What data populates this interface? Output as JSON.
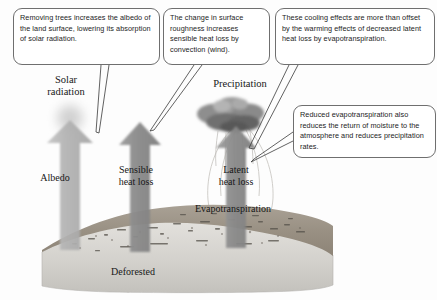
{
  "figure": {
    "type": "process-diagram",
    "scene_label": "Deforested"
  },
  "callouts": [
    {
      "id": "albedo-callout",
      "text": "Removing trees increases the albedo of the land surface, lowering its absorption of solar radiation.",
      "points_to": "Albedo arrow"
    },
    {
      "id": "sensible-heat-callout",
      "text": "The change in surface roughness increases sensible heat loss by convection (wind).",
      "points_to": "Sensible heat loss arrow"
    },
    {
      "id": "latent-heat-callout",
      "text": "These cooling effects are more than offset by the warming effects of decreased latent heat loss by evapotranspiration.",
      "points_to": "Latent heat loss arrow"
    },
    {
      "id": "precipitation-callout",
      "text": "Reduced evapotranspiration also reduces the return of moisture to the atmosphere and reduces precipitation rates.",
      "points_to": "Latent heat loss arrow"
    }
  ],
  "labels": {
    "solar_radiation": "Solar\nradiation",
    "precipitation": "Precipitation",
    "albedo": "Albedo",
    "sensible_heat_loss": "Sensible\nheat loss",
    "latent_heat_loss": "Latent\nheat loss",
    "evapotranspiration": "Evapotranspiration",
    "deforested": "Deforested"
  },
  "icons": {
    "sun": "sun-icon",
    "cloud": "rain-cloud-icon",
    "albedo_arrow": "up-arrow-icon",
    "sensible_arrow": "up-arrow-icon",
    "latent_arrow": "up-arrow-icon",
    "ground": "terrain-icon",
    "plume": "vapor-plume-icon"
  },
  "colors": {
    "background": "#fdfdfd",
    "callout_border": "#6f6f6f",
    "callout_fill": "#ffffff",
    "text": "#1d1d1d",
    "label_text": "#171717",
    "sun_glow": "#cfcfcf",
    "cloud_dark": "#5f5f5f",
    "cloud_light": "#9a9a9a",
    "arrow_light": "#b4b4b4",
    "arrow_dark": "#8e8e8e",
    "ground_top": "#9a9186",
    "ground_side": "#d8d6d2",
    "leader_line": "#3a3a3a"
  }
}
